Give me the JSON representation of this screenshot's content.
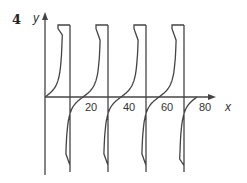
{
  "question_number": "4",
  "chart_data": {
    "type": "line",
    "title": "",
    "xlabel": "x",
    "ylabel": "y",
    "x_ticks": [
      "20",
      "40",
      "60",
      "80"
    ],
    "x_tick_values": [
      20,
      40,
      60,
      80
    ],
    "xlim": [
      0,
      90
    ],
    "grid": false,
    "legend": null,
    "period": 20,
    "zeros": [
      0,
      20,
      40,
      60,
      80
    ],
    "asymptotes": [
      10,
      30,
      50,
      70
    ],
    "series": [
      {
        "name": "branch-1",
        "x_range": [
          0,
          10
        ]
      },
      {
        "name": "branch-2",
        "x_range": [
          10,
          30
        ]
      },
      {
        "name": "branch-3",
        "x_range": [
          30,
          50
        ]
      },
      {
        "name": "branch-4",
        "x_range": [
          50,
          70
        ]
      },
      {
        "name": "branch-5",
        "x_range": [
          70,
          80
        ]
      }
    ]
  }
}
